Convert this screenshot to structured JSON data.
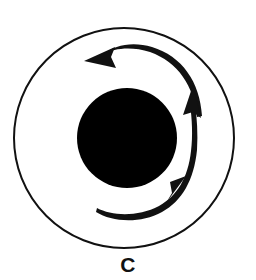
{
  "figure": {
    "caption": "C",
    "title": "",
    "background_color": "#ffffff",
    "stroke_color": "#111111",
    "fill_color": "#000000",
    "elements": {
      "outer_circle": {
        "name": "outer-circle",
        "center_x": 124,
        "center_y": 138,
        "radius": 110,
        "stroke_width": 2,
        "fill": "none"
      },
      "inner_disk": {
        "name": "inner-black-disk",
        "center_x": 127,
        "center_y": 138,
        "radius": 50,
        "fill": "#000000"
      },
      "arrow_top": {
        "name": "top-curved-arrow",
        "direction": "counterclockwise",
        "arrowhead_x": 99,
        "arrowhead_y": 57,
        "arrowhead_angle_deg": 192,
        "tail_x": 201,
        "tail_y": 112,
        "arc_radius": 72,
        "stroke_width": 4
      },
      "arrow_bottom": {
        "name": "bottom-curved-arrow",
        "direction": "counterclockwise",
        "arrowhead_x": 190,
        "arrowhead_y": 184,
        "arrowhead_angle_deg": 310,
        "tail_x": 97,
        "tail_y": 214,
        "arc_radius": 72,
        "stroke_width": 4
      },
      "arrow_right": {
        "name": "right-curved-arrow",
        "direction": "counterclockwise",
        "arrowhead_x": 197,
        "arrowhead_y": 89,
        "arrowhead_angle_deg": 290,
        "stroke_width": 4
      }
    }
  }
}
